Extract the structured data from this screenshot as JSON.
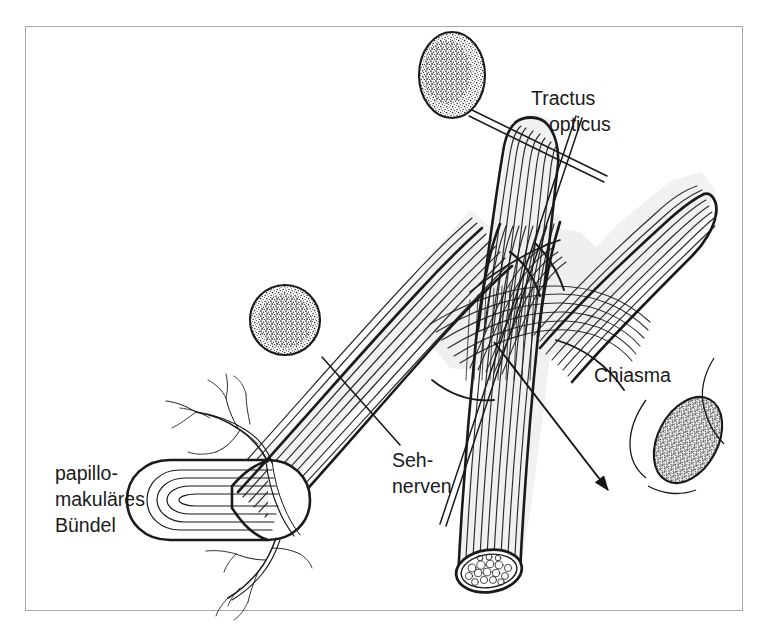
{
  "figure": {
    "kind": "anatomical-line-drawing",
    "language": "de",
    "background_color": "#ffffff",
    "ink_color": "#1a1a1a",
    "border_color": "#a8a8a8"
  },
  "labels": {
    "tractus_opticus_line1": "Tractus",
    "tractus_opticus_line2": "opticus",
    "chiasma": "Chiasma",
    "sehnerven_line1": "Seh-",
    "sehnerven_line2": "nerven",
    "papillomakulaeres_line1": "papillo-",
    "papillomakulaeres_line2": "makuläres",
    "papillomakulaeres_line3": "Bündel"
  },
  "structures": [
    {
      "name": "optic-disc",
      "description": "Papille mit papillomakulärem Bündel"
    },
    {
      "name": "retinal-vessels",
      "description": "Netzhautgefäße"
    },
    {
      "name": "left-optic-nerve",
      "description": "Sehnerv links"
    },
    {
      "name": "right-optic-nerve",
      "description": "Sehnerv rechts mit Querschnitt"
    },
    {
      "name": "optic-chiasm",
      "description": "Chiasma opticum, kreuzende Fasern"
    },
    {
      "name": "left-optic-tract",
      "description": "Tractus opticus oben"
    },
    {
      "name": "right-optic-tract",
      "description": "Tractus opticus rechts"
    },
    {
      "name": "nerve-cross-section",
      "description": "Querschnitt mit Faserbündeln"
    }
  ],
  "visual_field_insets": [
    {
      "name": "inset-top-ellipse",
      "shape": "ellipse",
      "fill": "stippled"
    },
    {
      "name": "inset-middle-circle",
      "shape": "circle",
      "fill": "stippled"
    },
    {
      "name": "inset-right-ellipse",
      "shape": "tilted-ellipse",
      "fill": "stippled"
    }
  ],
  "pointers": [
    {
      "name": "pointer-tractus-opticus",
      "style": "double-line"
    },
    {
      "name": "pointer-sehnerven-upper",
      "style": "double-line"
    },
    {
      "name": "pointer-sehnerven-lower",
      "style": "single-line"
    },
    {
      "name": "pointer-chiasma",
      "style": "arrow"
    }
  ]
}
